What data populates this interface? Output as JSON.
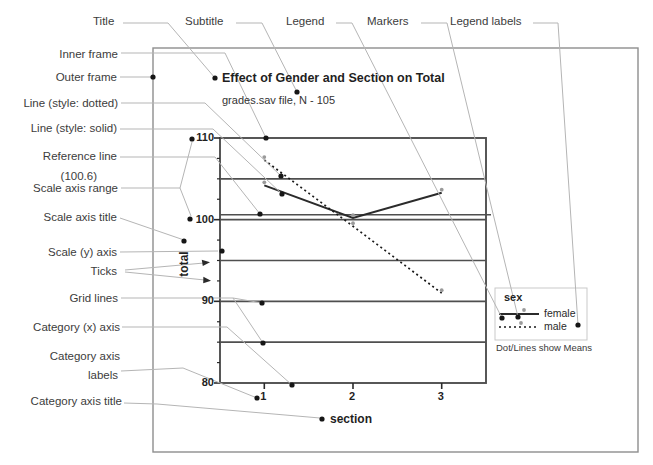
{
  "palette": {
    "callout_line": "#b5b5b5",
    "annotation_dot": "#161616",
    "inner_frame": "#4f4f4f",
    "outer_frame": "#8e8e8e",
    "gridline": "#4f4f4f",
    "series_female": "#2b2b2b",
    "series_male": "#1a1a1a",
    "marker": "#9a9a9a",
    "legend_box": "#c9c9c9"
  },
  "annotations": {
    "top": [
      {
        "text": "Title"
      },
      {
        "text": "Subtitle"
      },
      {
        "text": "Legend"
      },
      {
        "text": "Markers"
      },
      {
        "text": "Legend labels"
      }
    ],
    "left": [
      {
        "text": "Inner frame"
      },
      {
        "text": "Outer frame"
      },
      {
        "text": "Line (style: dotted)"
      },
      {
        "text": "Line (style: solid)"
      },
      {
        "text": "Reference line"
      },
      {
        "text": "(100.6)"
      },
      {
        "text": "Scale axis range"
      },
      {
        "text": "Scale axis title"
      },
      {
        "text": "Scale (y) axis"
      },
      {
        "text": "Ticks"
      },
      {
        "text": "Grid lines"
      },
      {
        "text": "Category (x) axis"
      },
      {
        "text": "Category axis"
      },
      {
        "text": "labels"
      },
      {
        "text": "Category axis title"
      }
    ]
  },
  "chart_data": {
    "type": "line",
    "title": "Effect of Gender and Section on Total",
    "subtitle": "grades.sav file, N - 105",
    "xlabel": "section",
    "ylabel": "total",
    "categories": [
      "1",
      "2",
      "3"
    ],
    "series": [
      {
        "name": "female",
        "style": "solid",
        "values": [
          104.2,
          100.2,
          103.3
        ]
      },
      {
        "name": "male",
        "style": "dotted",
        "values": [
          107.3,
          99.2,
          91.0
        ]
      }
    ],
    "reference_line": 100.6,
    "ylim": [
      80,
      110
    ],
    "yticks": [
      80,
      90,
      100,
      110
    ],
    "minor_ticks": [
      82.5,
      85,
      87.5,
      92.5,
      95,
      97.5,
      102.5,
      105,
      107.5
    ],
    "gridline_values": [
      85,
      90,
      95,
      100,
      105
    ],
    "grid": "horizontal",
    "legend": {
      "title": "sex",
      "entries": [
        "female",
        "male"
      ],
      "position": "right",
      "note": "Dot/Lines show Means"
    }
  }
}
